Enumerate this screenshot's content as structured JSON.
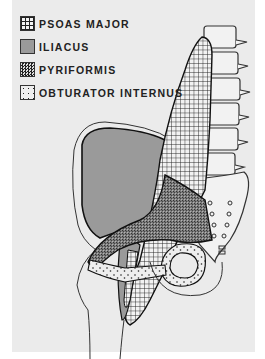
{
  "legend": {
    "items": [
      {
        "label": "PSOAS MAJOR",
        "pattern": "grid"
      },
      {
        "label": "ILIACUS",
        "pattern": "solid-gray"
      },
      {
        "label": "PYRIFORMIS",
        "pattern": "fine-checker"
      },
      {
        "label": "OBTURATOR INTERNUS",
        "pattern": "dots"
      }
    ]
  },
  "colors": {
    "background": "#ebebeb",
    "iliacus_fill": "#9a9a9a",
    "line": "#222222"
  }
}
